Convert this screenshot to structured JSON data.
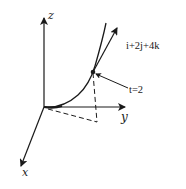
{
  "diagram": {
    "title": "",
    "axes": {
      "z_label": "z",
      "y_label": "y",
      "x_label": "x"
    },
    "curve": {
      "description": "space curve starting at origin",
      "point_label": "t=2",
      "tangent_label": "i+2j+4k"
    },
    "colors": {
      "stroke": "#1a1a1a",
      "background": "#ffffff"
    }
  }
}
